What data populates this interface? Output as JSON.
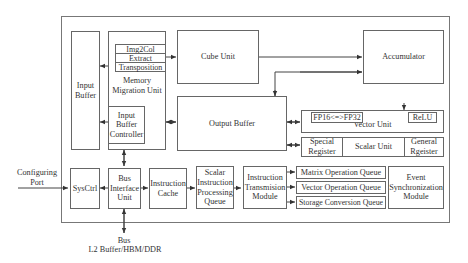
{
  "diagram": {
    "external": {
      "configuring_port": "Configuring Port",
      "bus_label": "Bus",
      "bus_memory": "L2 Buffer/HBM/DDR"
    },
    "blocks": {
      "input_buffer": "Input Buffer",
      "memory_migration_unit": "Memory Migration Unit",
      "img2col": "Img2Col",
      "extract": "Extract",
      "transposition": "Transposition",
      "input_buffer_controller": "Input Buffer Controller",
      "cube_unit": "Cube Unit",
      "accumulator": "Accumulator",
      "output_buffer": "Output Buffer",
      "vector_unit": "Vector Unit",
      "fp16_fp32": "FP16<=>FP32",
      "relu": "ReLU",
      "special_register": "Special Register",
      "scalar_unit": "Scalar Unit",
      "general_register": "General Rgeister",
      "sysctrl": "SysCtrl",
      "bus_interface_unit": "Bus Interface Unit",
      "instruction_cache": "Instruction Cache",
      "scalar_instruction_processing_queue": "Scalar Instruction Processing Queue",
      "instruction_transmission_module": "Instruction Transmision Module",
      "matrix_operation_queue": "Matrix Operation Queue",
      "vector_operation_queue": "Vector Operation Queue",
      "storage_conversion_queue": "Storage Conversion Queue",
      "event_synchronization_module": "Event Synchronization Module"
    }
  }
}
